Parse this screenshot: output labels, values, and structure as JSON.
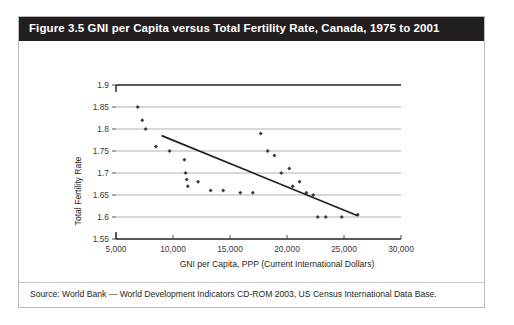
{
  "figure": {
    "title": "Figure 3.5 GNI per Capita versus Total Fertility Rate, Canada, 1975 to 2001",
    "source": "Source: World Bank — World Development Indicators CD-ROM 2003, US Census International Data Base."
  },
  "colors": {
    "title_bar": "#231f20",
    "title_text": "#ffffff",
    "gridline": "#a8a8a8",
    "axis": "#3a3a3a",
    "marker": "#3b3b4f",
    "trendline": "#231f20",
    "frame": "#b9b9b9",
    "page_background": "#ffffff"
  },
  "chart_data": {
    "type": "scatter",
    "title": "Figure 3.5 GNI per Capita versus Total Fertility Rate, Canada, 1975 to 2001",
    "xlabel": "GNI per Capita, PPP (Current International Dollars)",
    "ylabel": "Total Fertility Rate",
    "xlim": [
      5000,
      30000
    ],
    "ylim": [
      1.55,
      1.9
    ],
    "xticks": [
      5000,
      10000,
      15000,
      20000,
      25000,
      30000
    ],
    "xtick_labels": [
      "5,000",
      "10,000",
      "15,000",
      "20,000",
      "25,000",
      "30,000"
    ],
    "yticks": [
      1.55,
      1.6,
      1.65,
      1.7,
      1.75,
      1.8,
      1.85,
      1.9
    ],
    "ytick_labels": [
      "1.55",
      "1.6",
      "1.65",
      "1.7",
      "1.75",
      "1.8",
      "1.85",
      "1.9"
    ],
    "grid": "horizontal",
    "legend": "none",
    "series": [
      {
        "name": "Canada, 1975 to 2001",
        "marker": "diamond",
        "points": [
          {
            "x": 6900,
            "y": 1.85
          },
          {
            "x": 7300,
            "y": 1.82
          },
          {
            "x": 7600,
            "y": 1.8
          },
          {
            "x": 8500,
            "y": 1.76
          },
          {
            "x": 9700,
            "y": 1.75
          },
          {
            "x": 11000,
            "y": 1.73
          },
          {
            "x": 11100,
            "y": 1.7
          },
          {
            "x": 11200,
            "y": 1.685
          },
          {
            "x": 11300,
            "y": 1.67
          },
          {
            "x": 12200,
            "y": 1.68
          },
          {
            "x": 13300,
            "y": 1.66
          },
          {
            "x": 14400,
            "y": 1.66
          },
          {
            "x": 15900,
            "y": 1.655
          },
          {
            "x": 17000,
            "y": 1.655
          },
          {
            "x": 17700,
            "y": 1.79
          },
          {
            "x": 18300,
            "y": 1.75
          },
          {
            "x": 18900,
            "y": 1.74
          },
          {
            "x": 19500,
            "y": 1.7
          },
          {
            "x": 20200,
            "y": 1.71
          },
          {
            "x": 20500,
            "y": 1.67
          },
          {
            "x": 21100,
            "y": 1.68
          },
          {
            "x": 21700,
            "y": 1.655
          },
          {
            "x": 22300,
            "y": 1.65
          },
          {
            "x": 22700,
            "y": 1.6
          },
          {
            "x": 23400,
            "y": 1.6
          },
          {
            "x": 24800,
            "y": 1.6
          },
          {
            "x": 26200,
            "y": 1.605
          }
        ]
      }
    ],
    "trendline": {
      "type": "linear",
      "x_start": 9000,
      "y_start": 1.785,
      "x_end": 26200,
      "y_end": 1.603
    }
  }
}
